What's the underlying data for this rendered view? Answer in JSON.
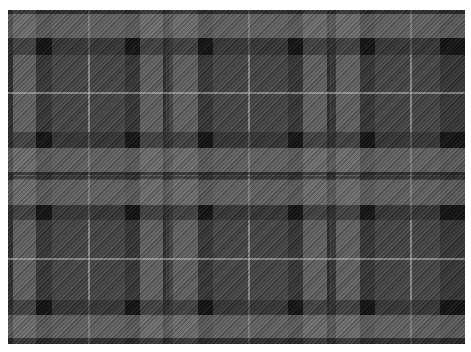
{
  "image": {
    "subject": "grey and black tartan plaid fabric swatch",
    "background": "#ffffff",
    "fabric_bounds": {
      "x": 8,
      "y": 10,
      "width": 457,
      "height": 334
    }
  },
  "palette": {
    "light_grey": "#7a7a7a",
    "mid_grey": "#4a4a4a",
    "dark_twill": "#2c2c2c",
    "black": "#111111",
    "white_line": "#c4c4c4"
  },
  "vertical_stripes": [
    {
      "x": 0,
      "w": 5,
      "color": "#1c1c1c"
    },
    {
      "x": 5,
      "w": 23,
      "color": "#7a7a7a"
    },
    {
      "x": 28,
      "w": 16,
      "color": "#2c2c2c"
    },
    {
      "x": 80,
      "w": 2,
      "color": "#c4c4c4"
    },
    {
      "x": 117,
      "w": 15,
      "color": "#2c2c2c"
    },
    {
      "x": 132,
      "w": 23,
      "color": "#7a7a7a"
    },
    {
      "x": 155,
      "w": 3,
      "color": "#1c1c1c"
    },
    {
      "x": 159,
      "w": 2,
      "color": "#2c2c2c"
    },
    {
      "x": 165,
      "w": 25,
      "color": "#7a7a7a"
    },
    {
      "x": 190,
      "w": 15,
      "color": "#2c2c2c"
    },
    {
      "x": 240,
      "w": 2,
      "color": "#c4c4c4"
    },
    {
      "x": 280,
      "w": 15,
      "color": "#2c2c2c"
    },
    {
      "x": 295,
      "w": 24,
      "color": "#7a7a7a"
    },
    {
      "x": 319,
      "w": 3,
      "color": "#1c1c1c"
    },
    {
      "x": 323,
      "w": 5,
      "color": "#2c2c2c"
    },
    {
      "x": 328,
      "w": 24,
      "color": "#7a7a7a"
    },
    {
      "x": 352,
      "w": 15,
      "color": "#2c2c2c"
    },
    {
      "x": 402,
      "w": 2,
      "color": "#c4c4c4"
    },
    {
      "x": 432,
      "w": 25,
      "color": "#2c2c2c"
    }
  ],
  "horizontal_stripes": [
    {
      "y": 0,
      "h": 4,
      "color": "#1c1c1c"
    },
    {
      "y": 4,
      "h": 24,
      "color": "#7a7a7a"
    },
    {
      "y": 28,
      "h": 17,
      "color": "#2c2c2c"
    },
    {
      "y": 82,
      "h": 2,
      "color": "#c4c4c4"
    },
    {
      "y": 122,
      "h": 16,
      "color": "#2c2c2c"
    },
    {
      "y": 138,
      "h": 24,
      "color": "#7a7a7a"
    },
    {
      "y": 162,
      "h": 3,
      "color": "#1c1c1c"
    },
    {
      "y": 166,
      "h": 3,
      "color": "#2c2c2c"
    },
    {
      "y": 170,
      "h": 25,
      "color": "#7a7a7a"
    },
    {
      "y": 195,
      "h": 15,
      "color": "#2c2c2c"
    },
    {
      "y": 248,
      "h": 2,
      "color": "#c4c4c4"
    },
    {
      "y": 290,
      "h": 15,
      "color": "#2c2c2c"
    },
    {
      "y": 305,
      "h": 23,
      "color": "#7a7a7a"
    },
    {
      "y": 328,
      "h": 6,
      "color": "#1c1c1c"
    }
  ],
  "dark_intersections": [
    {
      "x": 28,
      "y": 28,
      "w": 16,
      "h": 17
    },
    {
      "x": 117,
      "y": 28,
      "w": 15,
      "h": 17
    },
    {
      "x": 190,
      "y": 28,
      "w": 15,
      "h": 17
    },
    {
      "x": 280,
      "y": 28,
      "w": 15,
      "h": 17
    },
    {
      "x": 352,
      "y": 28,
      "w": 15,
      "h": 17
    },
    {
      "x": 432,
      "y": 28,
      "w": 25,
      "h": 17
    },
    {
      "x": 28,
      "y": 122,
      "w": 16,
      "h": 16
    },
    {
      "x": 117,
      "y": 122,
      "w": 15,
      "h": 16
    },
    {
      "x": 190,
      "y": 122,
      "w": 15,
      "h": 16
    },
    {
      "x": 280,
      "y": 122,
      "w": 15,
      "h": 16
    },
    {
      "x": 352,
      "y": 122,
      "w": 15,
      "h": 16
    },
    {
      "x": 432,
      "y": 122,
      "w": 25,
      "h": 16
    },
    {
      "x": 28,
      "y": 195,
      "w": 16,
      "h": 15
    },
    {
      "x": 117,
      "y": 195,
      "w": 15,
      "h": 15
    },
    {
      "x": 190,
      "y": 195,
      "w": 15,
      "h": 15
    },
    {
      "x": 280,
      "y": 195,
      "w": 15,
      "h": 15
    },
    {
      "x": 352,
      "y": 195,
      "w": 15,
      "h": 15
    },
    {
      "x": 432,
      "y": 195,
      "w": 25,
      "h": 15
    },
    {
      "x": 28,
      "y": 290,
      "w": 16,
      "h": 15
    },
    {
      "x": 117,
      "y": 290,
      "w": 15,
      "h": 15
    },
    {
      "x": 190,
      "y": 290,
      "w": 15,
      "h": 15
    },
    {
      "x": 280,
      "y": 290,
      "w": 15,
      "h": 15
    },
    {
      "x": 352,
      "y": 290,
      "w": 15,
      "h": 15
    },
    {
      "x": 432,
      "y": 290,
      "w": 25,
      "h": 15
    }
  ]
}
